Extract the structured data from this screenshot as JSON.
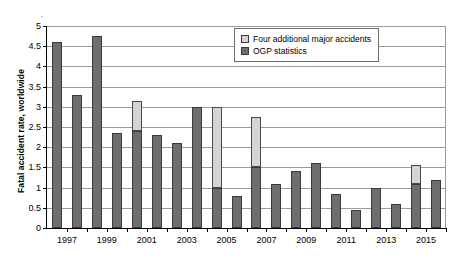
{
  "chart_data": {
    "type": "bar",
    "stacked": true,
    "title": "",
    "xlabel": "",
    "ylabel": "Fatal accident rate, worldwide",
    "ylim": [
      0,
      5
    ],
    "ytick_step": 0.5,
    "yticks": [
      "0",
      "0.5",
      "1",
      "1.5",
      "2",
      "2.5",
      "3",
      "3.5",
      "4",
      "4.5",
      "5"
    ],
    "grid": true,
    "grid_axis": "y",
    "legend_position": "top-right",
    "categories": [
      "1997",
      "1998",
      "1999",
      "2000",
      "2001",
      "2002",
      "2003",
      "2004",
      "2005",
      "2006",
      "2007",
      "2008",
      "2009",
      "2010",
      "2011",
      "2012",
      "2013",
      "2014",
      "2015",
      "2016"
    ],
    "xtick_labels": [
      "1997",
      "",
      "1999",
      "",
      "2001",
      "",
      "2003",
      "",
      "2005",
      "",
      "2007",
      "",
      "2009",
      "",
      "2011",
      "",
      "2013",
      "",
      "2015",
      ""
    ],
    "series": [
      {
        "name": "OGP statistics",
        "color": "#6e6e6e",
        "values": [
          4.6,
          3.3,
          4.75,
          2.35,
          2.4,
          2.3,
          2.1,
          3.0,
          1.0,
          0.8,
          1.5,
          1.1,
          1.4,
          1.6,
          0.85,
          0.45,
          1.0,
          0.6,
          1.1,
          1.2
        ]
      },
      {
        "name": "Four additional major accidents",
        "color": "#d4d4d4",
        "values": [
          0,
          0,
          0,
          0,
          0.75,
          0,
          0,
          0,
          2.0,
          0,
          1.25,
          0,
          0,
          0,
          0,
          0,
          0,
          0,
          0.45,
          0
        ]
      }
    ],
    "totals": [
      4.6,
      3.3,
      4.75,
      2.35,
      3.15,
      2.3,
      2.1,
      3.0,
      3.0,
      0.8,
      2.75,
      1.1,
      1.4,
      1.6,
      0.85,
      0.45,
      1.0,
      0.6,
      1.55,
      1.2
    ]
  },
  "legend": {
    "items": [
      {
        "label": "Four additional major accidents",
        "swatch": "light-gray"
      },
      {
        "label": "OGP statistics",
        "swatch": "dark-gray"
      }
    ]
  },
  "axis": {
    "y_title": "Fatal accident rate, worldwide"
  },
  "colors": {
    "series_base": "#6e6e6e",
    "series_extra": "#d4d4d4",
    "gridline": "#9a9a9a",
    "axis": "#000000",
    "background": "#ffffff"
  },
  "marks": {
    "stray": "'"
  }
}
